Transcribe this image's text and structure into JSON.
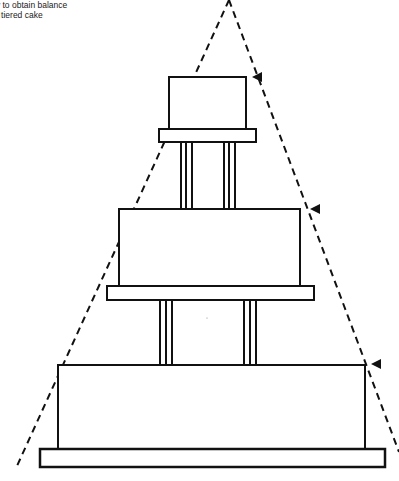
{
  "caption": {
    "line1": "w to obtain balance",
    "line2": "a tiered cake"
  },
  "diagram": {
    "guide_lines": {
      "style": "dashed",
      "apex": [
        229,
        0
      ],
      "left_end": [
        17,
        466
      ],
      "right_end": [
        399,
        452
      ]
    },
    "tiers": [
      {
        "name": "top-tier",
        "x": 169,
        "y": 77,
        "w": 77,
        "h": 52,
        "plate": {
          "x": 159,
          "y": 129,
          "w": 97,
          "h": 13
        },
        "marker": [
          252,
          77
        ]
      },
      {
        "name": "middle-tier",
        "x": 119,
        "y": 209,
        "w": 181,
        "h": 77,
        "plate": {
          "x": 107,
          "y": 286,
          "w": 207,
          "h": 14
        },
        "marker": [
          310,
          209
        ]
      },
      {
        "name": "bottom-tier",
        "x": 58,
        "y": 365,
        "w": 307,
        "h": 84,
        "plate": {
          "x": 40,
          "y": 449,
          "w": 345,
          "h": 18
        },
        "marker": [
          371,
          364
        ]
      }
    ],
    "pillars": [
      {
        "x": 180,
        "y1": 142,
        "y2": 209
      },
      {
        "x": 224,
        "y1": 142,
        "y2": 209
      },
      {
        "x": 159,
        "y1": 300,
        "y2": 365
      },
      {
        "x": 243,
        "y1": 300,
        "y2": 365
      }
    ],
    "colors": {
      "stroke": "#111111",
      "fill": "#ffffff"
    }
  }
}
